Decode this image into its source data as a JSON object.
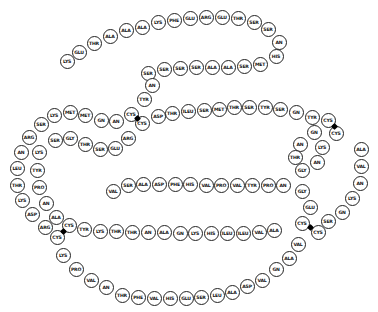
{
  "residues": [
    {
      "label": "LYS",
      "x": 67,
      "y": 61
    },
    {
      "label": "GLU",
      "x": 79,
      "y": 52
    },
    {
      "label": "THR",
      "x": 94,
      "y": 43
    },
    {
      "label": "ALA",
      "x": 110,
      "y": 36
    },
    {
      "label": "ALA",
      "x": 126,
      "y": 30
    },
    {
      "label": "ALA",
      "x": 142,
      "y": 27
    },
    {
      "label": "LYS",
      "x": 158,
      "y": 22
    },
    {
      "label": "PHE",
      "x": 174,
      "y": 20
    },
    {
      "label": "GLU",
      "x": 190,
      "y": 18
    },
    {
      "label": "ARG",
      "x": 206,
      "y": 17
    },
    {
      "label": "GLU",
      "x": 222,
      "y": 17
    },
    {
      "label": "THR",
      "x": 238,
      "y": 18
    },
    {
      "label": "SER",
      "x": 254,
      "y": 22
    },
    {
      "label": "SER",
      "x": 268,
      "y": 29
    },
    {
      "label": "AN",
      "x": 279,
      "y": 42
    },
    {
      "label": "HIS",
      "x": 276,
      "y": 56
    },
    {
      "label": "MET",
      "x": 260,
      "y": 64
    },
    {
      "label": "SER",
      "x": 244,
      "y": 66
    },
    {
      "label": "ALA",
      "x": 228,
      "y": 67
    },
    {
      "label": "ALA",
      "x": 212,
      "y": 67
    },
    {
      "label": "SER",
      "x": 196,
      "y": 67
    },
    {
      "label": "SER",
      "x": 180,
      "y": 68
    },
    {
      "label": "SER",
      "x": 164,
      "y": 69
    },
    {
      "label": "SER",
      "x": 148,
      "y": 73
    },
    {
      "label": "AN",
      "x": 152,
      "y": 85
    },
    {
      "label": "TYR",
      "x": 144,
      "y": 99
    },
    {
      "label": "CYS",
      "x": 131,
      "y": 114
    },
    {
      "label": "LYS",
      "x": 54,
      "y": 115
    },
    {
      "label": "MET",
      "x": 70,
      "y": 112
    },
    {
      "label": "MET",
      "x": 85,
      "y": 115
    },
    {
      "label": "GN",
      "x": 101,
      "y": 120
    },
    {
      "label": "AN",
      "x": 116,
      "y": 121
    },
    {
      "label": "SER",
      "x": 41,
      "y": 124
    },
    {
      "label": "ARG",
      "x": 29,
      "y": 137
    },
    {
      "label": "AN",
      "x": 21,
      "y": 152
    },
    {
      "label": "LEU",
      "x": 17,
      "y": 168
    },
    {
      "label": "THR",
      "x": 17,
      "y": 185
    },
    {
      "label": "LYS",
      "x": 22,
      "y": 200
    },
    {
      "label": "ASP",
      "x": 32,
      "y": 214
    },
    {
      "label": "ARG",
      "x": 45,
      "y": 227
    },
    {
      "label": "CYS",
      "x": 57,
      "y": 237
    },
    {
      "label": "LYS",
      "x": 63,
      "y": 255
    },
    {
      "label": "PRO",
      "x": 76,
      "y": 269
    },
    {
      "label": "VAL",
      "x": 91,
      "y": 280
    },
    {
      "label": "AN",
      "x": 106,
      "y": 287
    },
    {
      "label": "THR",
      "x": 122,
      "y": 295
    },
    {
      "label": "PHE",
      "x": 138,
      "y": 297
    },
    {
      "label": "VAL",
      "x": 154,
      "y": 298
    },
    {
      "label": "HIS",
      "x": 170,
      "y": 298
    },
    {
      "label": "GLU",
      "x": 186,
      "y": 298
    },
    {
      "label": "SER",
      "x": 201,
      "y": 297
    },
    {
      "label": "LEU",
      "x": 217,
      "y": 295
    },
    {
      "label": "ALA",
      "x": 232,
      "y": 292
    },
    {
      "label": "ASP",
      "x": 247,
      "y": 286
    },
    {
      "label": "VAL",
      "x": 262,
      "y": 280
    },
    {
      "label": "GN",
      "x": 276,
      "y": 269
    },
    {
      "label": "ALA",
      "x": 289,
      "y": 258
    },
    {
      "label": "VAL",
      "x": 298,
      "y": 244
    },
    {
      "label": "CYS",
      "x": 318,
      "y": 232
    },
    {
      "label": "LYS",
      "x": 39,
      "y": 152
    },
    {
      "label": "SER",
      "x": 55,
      "y": 140
    },
    {
      "label": "GLY",
      "x": 70,
      "y": 138
    },
    {
      "label": "THR",
      "x": 85,
      "y": 144
    },
    {
      "label": "SER",
      "x": 100,
      "y": 149
    },
    {
      "label": "GLU",
      "x": 115,
      "y": 148
    },
    {
      "label": "ARG",
      "x": 128,
      "y": 138
    },
    {
      "label": "TYR",
      "x": 37,
      "y": 170
    },
    {
      "label": "PRO",
      "x": 39,
      "y": 187
    },
    {
      "label": "AN",
      "x": 46,
      "y": 203
    },
    {
      "label": "ALA",
      "x": 56,
      "y": 217
    },
    {
      "label": "CYS",
      "x": 69,
      "y": 225
    },
    {
      "label": "TYR",
      "x": 84,
      "y": 229
    },
    {
      "label": "LYS",
      "x": 100,
      "y": 231
    },
    {
      "label": "THR",
      "x": 116,
      "y": 231
    },
    {
      "label": "THR",
      "x": 132,
      "y": 232
    },
    {
      "label": "AN",
      "x": 148,
      "y": 232
    },
    {
      "label": "ALA",
      "x": 164,
      "y": 232
    },
    {
      "label": "GN",
      "x": 180,
      "y": 233
    },
    {
      "label": "LYS",
      "x": 195,
      "y": 233
    },
    {
      "label": "HIS",
      "x": 211,
      "y": 233
    },
    {
      "label": "ILEU",
      "x": 227,
      "y": 233
    },
    {
      "label": "ILEU",
      "x": 243,
      "y": 233
    },
    {
      "label": "VAL",
      "x": 259,
      "y": 232
    },
    {
      "label": "ALA",
      "x": 274,
      "y": 230
    },
    {
      "label": "CYS",
      "x": 302,
      "y": 223
    },
    {
      "label": "CYS",
      "x": 142,
      "y": 123
    },
    {
      "label": "ASP",
      "x": 158,
      "y": 116
    },
    {
      "label": "THR",
      "x": 172,
      "y": 113
    },
    {
      "label": "ILEU",
      "x": 188,
      "y": 111
    },
    {
      "label": "SER",
      "x": 204,
      "y": 110
    },
    {
      "label": "MET",
      "x": 219,
      "y": 109
    },
    {
      "label": "THR",
      "x": 234,
      "y": 107
    },
    {
      "label": "SER",
      "x": 249,
      "y": 107
    },
    {
      "label": "TYR",
      "x": 265,
      "y": 107
    },
    {
      "label": "SER",
      "x": 280,
      "y": 109
    },
    {
      "label": "GN",
      "x": 296,
      "y": 112
    },
    {
      "label": "TYR",
      "x": 312,
      "y": 117
    },
    {
      "label": "CYS",
      "x": 328,
      "y": 120
    },
    {
      "label": "CYS",
      "x": 336,
      "y": 133
    },
    {
      "label": "GN",
      "x": 314,
      "y": 132
    },
    {
      "label": "AN",
      "x": 300,
      "y": 144
    },
    {
      "label": "THR",
      "x": 295,
      "y": 157
    },
    {
      "label": "GLY",
      "x": 302,
      "y": 170
    },
    {
      "label": "AN",
      "x": 317,
      "y": 162
    },
    {
      "label": "LYS",
      "x": 322,
      "y": 147
    },
    {
      "label": "ALA",
      "x": 361,
      "y": 149
    },
    {
      "label": "VAL",
      "x": 361,
      "y": 166
    },
    {
      "label": "AN",
      "x": 360,
      "y": 183
    },
    {
      "label": "LYS",
      "x": 352,
      "y": 198
    },
    {
      "label": "GN",
      "x": 342,
      "y": 212
    },
    {
      "label": "SER",
      "x": 328,
      "y": 221
    },
    {
      "label": "VAL",
      "x": 113,
      "y": 191
    },
    {
      "label": "SER",
      "x": 128,
      "y": 185
    },
    {
      "label": "ALA",
      "x": 143,
      "y": 184
    },
    {
      "label": "ASP",
      "x": 159,
      "y": 184
    },
    {
      "label": "PHE",
      "x": 175,
      "y": 184
    },
    {
      "label": "HIS",
      "x": 190,
      "y": 184
    },
    {
      "label": "VAL",
      "x": 206,
      "y": 185
    },
    {
      "label": "PRO",
      "x": 221,
      "y": 185
    },
    {
      "label": "VAL",
      "x": 237,
      "y": 185
    },
    {
      "label": "TYR",
      "x": 252,
      "y": 185
    },
    {
      "label": "PRO",
      "x": 268,
      "y": 185
    },
    {
      "label": "AN",
      "x": 283,
      "y": 185
    },
    {
      "label": "GLY",
      "x": 302,
      "y": 191
    },
    {
      "label": "GLU",
      "x": 310,
      "y": 207
    }
  ],
  "disulfide_bonds": [
    {
      "x": 137,
      "y": 118
    },
    {
      "x": 334,
      "y": 126
    },
    {
      "x": 63,
      "y": 231
    },
    {
      "x": 310,
      "y": 227
    }
  ]
}
